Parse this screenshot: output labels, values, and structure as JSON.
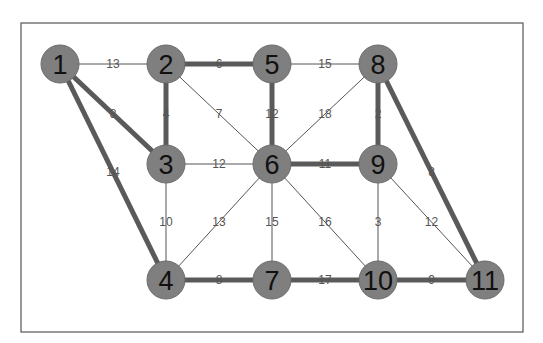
{
  "graph": {
    "frame": {
      "x": 21,
      "y": 23,
      "width": 502,
      "height": 309
    },
    "node_radius": 19,
    "nodes": [
      {
        "id": "1",
        "x": 60,
        "y": 64
      },
      {
        "id": "2",
        "x": 166,
        "y": 64
      },
      {
        "id": "3",
        "x": 166,
        "y": 164
      },
      {
        "id": "4",
        "x": 166,
        "y": 280
      },
      {
        "id": "5",
        "x": 272,
        "y": 64
      },
      {
        "id": "6",
        "x": 272,
        "y": 164
      },
      {
        "id": "7",
        "x": 272,
        "y": 280
      },
      {
        "id": "8",
        "x": 378,
        "y": 64
      },
      {
        "id": "9",
        "x": 378,
        "y": 164
      },
      {
        "id": "10",
        "x": 378,
        "y": 280
      },
      {
        "id": "11",
        "x": 485,
        "y": 280
      }
    ],
    "edges": [
      {
        "from": "1",
        "to": "2",
        "weight": "13",
        "highlighted": false
      },
      {
        "from": "1",
        "to": "3",
        "weight": "8",
        "highlighted": true
      },
      {
        "from": "1",
        "to": "4",
        "weight": "14",
        "highlighted": true
      },
      {
        "from": "2",
        "to": "5",
        "weight": "6",
        "highlighted": true
      },
      {
        "from": "2",
        "to": "3",
        "weight": "4",
        "highlighted": true
      },
      {
        "from": "2",
        "to": "6",
        "weight": "7",
        "highlighted": false
      },
      {
        "from": "3",
        "to": "6",
        "weight": "12",
        "highlighted": false
      },
      {
        "from": "3",
        "to": "4",
        "weight": "10",
        "highlighted": false
      },
      {
        "from": "4",
        "to": "6",
        "weight": "13",
        "highlighted": false
      },
      {
        "from": "4",
        "to": "7",
        "weight": "8",
        "highlighted": true
      },
      {
        "from": "5",
        "to": "8",
        "weight": "15",
        "highlighted": false
      },
      {
        "from": "5",
        "to": "6",
        "weight": "12",
        "highlighted": true
      },
      {
        "from": "6",
        "to": "8",
        "weight": "18",
        "highlighted": false
      },
      {
        "from": "8",
        "to": "9",
        "weight": "2",
        "highlighted": true
      },
      {
        "from": "8",
        "to": "11",
        "weight": "8",
        "highlighted": true
      },
      {
        "from": "6",
        "to": "9",
        "weight": "11",
        "highlighted": true
      },
      {
        "from": "6",
        "to": "7",
        "weight": "15",
        "highlighted": false
      },
      {
        "from": "6",
        "to": "10",
        "weight": "16",
        "highlighted": false
      },
      {
        "from": "9",
        "to": "10",
        "weight": "3",
        "highlighted": false
      },
      {
        "from": "9",
        "to": "11",
        "weight": "12",
        "highlighted": false
      },
      {
        "from": "7",
        "to": "10",
        "weight": "17",
        "highlighted": true
      },
      {
        "from": "10",
        "to": "11",
        "weight": "9",
        "highlighted": true
      }
    ]
  }
}
